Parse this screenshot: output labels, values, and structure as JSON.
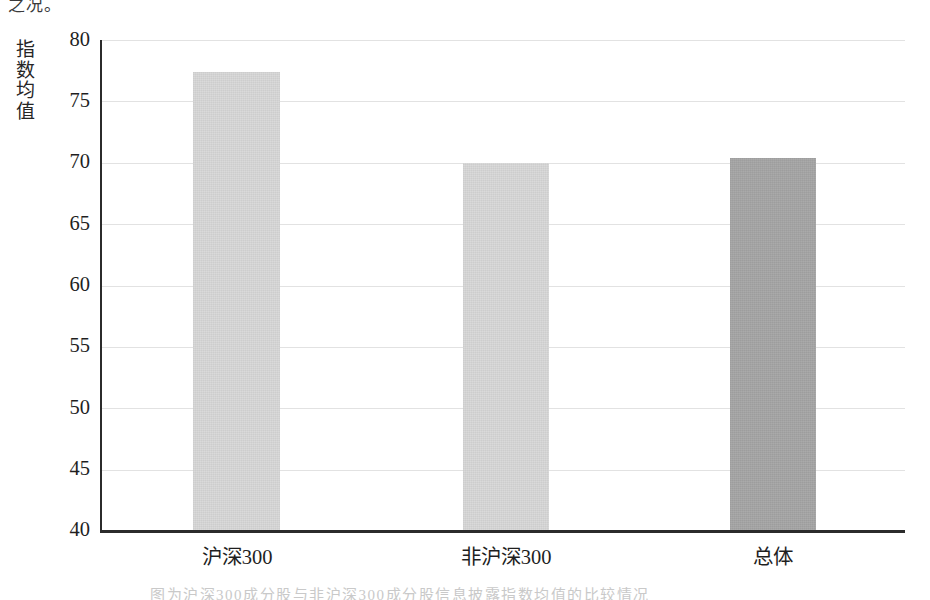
{
  "page": {
    "top_cut_text": "之况。",
    "bottom_cut_text": "图为沪深300成分股与非沪深300成分股信息披露指数均值的比较情况"
  },
  "chart_data": {
    "type": "bar",
    "title": "",
    "xlabel": "",
    "ylabel": "指数均值",
    "ylabel_chars": [
      "指",
      "数",
      "均",
      "值"
    ],
    "categories": [
      "沪深300",
      "非沪深300",
      "总体"
    ],
    "values": [
      77.4,
      70.0,
      70.4
    ],
    "series": [
      {
        "name": "指数均值",
        "values": [
          77.4,
          70.0,
          70.4
        ]
      }
    ],
    "ylim": [
      40,
      80
    ],
    "yticks": [
      80,
      75,
      70,
      65,
      60,
      55,
      50,
      45,
      40
    ],
    "ytick_labels": [
      "80",
      "75",
      "70",
      "65",
      "60",
      "55",
      "50",
      "45",
      "40"
    ],
    "grid": true,
    "grid_axis": "y",
    "legend": false,
    "legend_position": "none",
    "bar_colors": [
      "#d9d9d9",
      "#d9d9d9",
      "#a6a6a6"
    ],
    "axis_color": "#2b2b2b",
    "gridline_color": "#e2e2e2",
    "background": "#ffffff"
  }
}
